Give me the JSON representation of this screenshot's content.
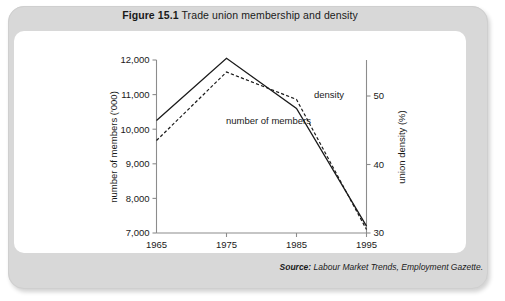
{
  "figure": {
    "number": "Figure 15.1",
    "title": "Trade union membership and density"
  },
  "source": {
    "label": "Source:",
    "text": "Labour Market Trends, Employment Gazette."
  },
  "colors": {
    "outer_frame": "#d8d8d8",
    "panel": "#ffffff",
    "axis": "#8c8c8c",
    "line": "#1a1a1a",
    "text": "#1a1a1a"
  },
  "chart_data": {
    "type": "line",
    "title": "Trade union membership and density",
    "xlabel": "",
    "ylabel": "number of members ('000)",
    "y2label": "union density (%)",
    "grid": false,
    "legend_position": "inline-annotations",
    "x": [
      1965,
      1975,
      1985,
      1995
    ],
    "xtick_labels": [
      "1965",
      "1975",
      "1985",
      "1995"
    ],
    "xlim": [
      1965,
      1995
    ],
    "ylim": [
      7000,
      12000
    ],
    "ytick_labels": [
      "7,000",
      "8,000",
      "9,000",
      "10,000",
      "11,000",
      "12,000"
    ],
    "yticks": [
      7000,
      8000,
      9000,
      10000,
      11000,
      12000
    ],
    "y2lim": [
      30,
      50
    ],
    "y2ticks": [
      30,
      40,
      50
    ],
    "y2tick_labels": [
      "30",
      "40",
      "50"
    ],
    "series": [
      {
        "name": "number of members",
        "axis": "left",
        "style": "solid",
        "unit": "'000",
        "values": [
          10250,
          12050,
          10600,
          7200
        ]
      },
      {
        "name": "density",
        "axis": "right",
        "style": "dashed",
        "unit": "%",
        "values": [
          43.5,
          53.5,
          49.5,
          30.5
        ]
      }
    ],
    "annotations": [
      {
        "text": "number of members",
        "x": 1981,
        "y": 10150
      },
      {
        "text": "density",
        "x": 1987.5,
        "y": 10900
      }
    ]
  }
}
